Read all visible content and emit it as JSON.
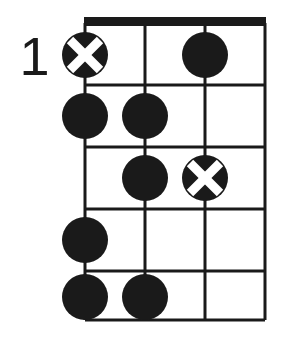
{
  "diagram": {
    "type": "guitar-chord-diagram",
    "title": "",
    "position_label": "1",
    "string_count": 4,
    "fret_count": 5,
    "has_nut": true,
    "colors": {
      "line": "#1a1a1a",
      "dot_fill": "#1a1a1a",
      "mark_cross": "#ffffff",
      "background": "#ffffff"
    },
    "geometry": {
      "left": 85,
      "right": 265,
      "top": 23,
      "bottom": 320,
      "nut_thickness": 9,
      "line_width": 3,
      "string_x": [
        85,
        145,
        205,
        265
      ],
      "fret_y": [
        23,
        85,
        147,
        209,
        271,
        320
      ],
      "dot_radius": 23,
      "mark_radius": 23
    },
    "markers": [
      {
        "name": "marker-s1-f1",
        "string": 1,
        "fret": 1,
        "shape": "cross-circle",
        "cx": 85,
        "cy": 55
      },
      {
        "name": "marker-s3-f1",
        "string": 3,
        "fret": 1,
        "shape": "dot",
        "cx": 205,
        "cy": 55
      },
      {
        "name": "marker-s1-f2",
        "string": 1,
        "fret": 2,
        "shape": "dot",
        "cx": 85,
        "cy": 116
      },
      {
        "name": "marker-s2-f2",
        "string": 2,
        "fret": 2,
        "shape": "dot",
        "cx": 145,
        "cy": 116
      },
      {
        "name": "marker-s2-f3",
        "string": 2,
        "fret": 3,
        "shape": "dot",
        "cx": 145,
        "cy": 178
      },
      {
        "name": "marker-s3-f3",
        "string": 3,
        "fret": 3,
        "shape": "cross-circle",
        "cx": 205,
        "cy": 178
      },
      {
        "name": "marker-s1-f4",
        "string": 1,
        "fret": 4,
        "shape": "dot",
        "cx": 85,
        "cy": 240
      },
      {
        "name": "marker-s1-f5",
        "string": 1,
        "fret": 5,
        "shape": "dot",
        "cx": 85,
        "cy": 297
      },
      {
        "name": "marker-s2-f5",
        "string": 2,
        "fret": 5,
        "shape": "dot",
        "cx": 145,
        "cy": 297
      }
    ]
  }
}
